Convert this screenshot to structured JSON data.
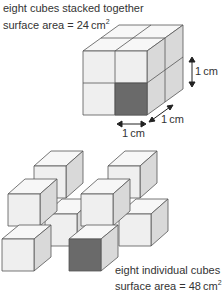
{
  "top": {
    "line1": "eight cubes stacked together",
    "line2_prefix": "surface area = 24 cm",
    "sup": "2"
  },
  "dims": {
    "height": "1 cm",
    "depth": "1 cm",
    "width": "1 cm"
  },
  "bottom": {
    "line1": "eight individual cubes",
    "line2_prefix": "surface area = 48 cm",
    "sup": "2"
  },
  "colors": {
    "face_front": "#efefef",
    "face_top": "#f7f7f7",
    "face_side": "#d9d9d9",
    "highlight": "#6a6a6a",
    "edge": "#555555"
  }
}
